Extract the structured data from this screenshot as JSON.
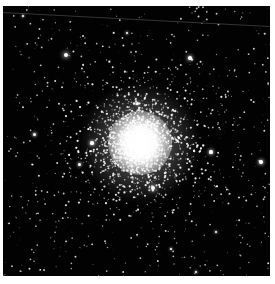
{
  "image": {
    "subject": "globular star cluster",
    "description": "Grayscale astronomical photograph of a dense globular cluster on a black star field",
    "frame": {
      "left": 3,
      "top": 6,
      "width": 267,
      "height": 270
    },
    "background_color": "#020202",
    "border_color": "#ffffff"
  },
  "cluster": {
    "center": {
      "x": 137,
      "y": 137
    },
    "core_radius": 20,
    "halo_radius": 62,
    "outer_radius": 100,
    "core_color": "#ffffff",
    "seed": 42,
    "cluster_star_count": 2600,
    "field_star_count": 700
  },
  "bright_stars": [
    {
      "x": 63,
      "y": 49,
      "r": 2.2
    },
    {
      "x": 187,
      "y": 52,
      "r": 1.8
    },
    {
      "x": 150,
      "y": 182,
      "r": 2.0
    },
    {
      "x": 208,
      "y": 146,
      "r": 1.6
    },
    {
      "x": 258,
      "y": 156,
      "r": 1.8
    },
    {
      "x": 31,
      "y": 128,
      "r": 1.5
    },
    {
      "x": 89,
      "y": 137,
      "r": 1.6
    },
    {
      "x": 76,
      "y": 158,
      "r": 1.5
    },
    {
      "x": 134,
      "y": 97,
      "r": 1.5
    },
    {
      "x": 124,
      "y": 27,
      "r": 1.3
    },
    {
      "x": 20,
      "y": 10,
      "r": 1.2
    },
    {
      "x": 213,
      "y": 226,
      "r": 1.3
    },
    {
      "x": 193,
      "y": 266,
      "r": 1.3
    },
    {
      "x": 168,
      "y": 243,
      "r": 1.2
    }
  ],
  "streak": {
    "x1": 0,
    "y1": 6,
    "x2": 267,
    "y2": 20
  }
}
